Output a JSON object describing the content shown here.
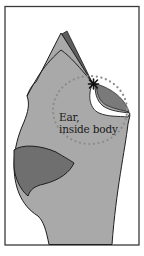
{
  "diagram": {
    "label_line1": "Ear,",
    "label_line2": "inside body",
    "caption": "",
    "colors": {
      "frame": "#3a3a3a",
      "body": "#a9a9a9",
      "body_back": "#5e5e5e",
      "lobe": "#6f6f6f",
      "outline": "#1e1e1e",
      "dots": "#8c8c8c",
      "canal_inner": "#7a7a7a"
    }
  }
}
